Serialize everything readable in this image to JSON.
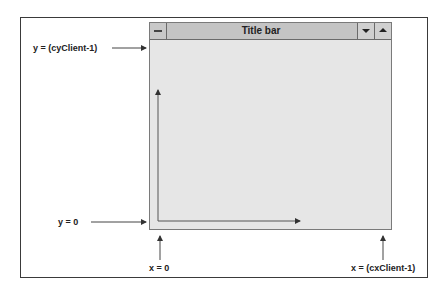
{
  "window": {
    "title": "Title bar",
    "system_menu_icon": "minus-bar-icon",
    "minimize_icon": "triangle-down-icon",
    "maximize_icon": "triangle-up-icon"
  },
  "labels": {
    "y_top": "y = (cyClient-1)",
    "y_bottom": "y = 0",
    "x_left": "x = 0",
    "x_right": "x = (cxClient-1)"
  },
  "colors": {
    "client_area": "#e6e6e6",
    "title_bar": "#c4c4c4",
    "arrow": "#444444"
  }
}
